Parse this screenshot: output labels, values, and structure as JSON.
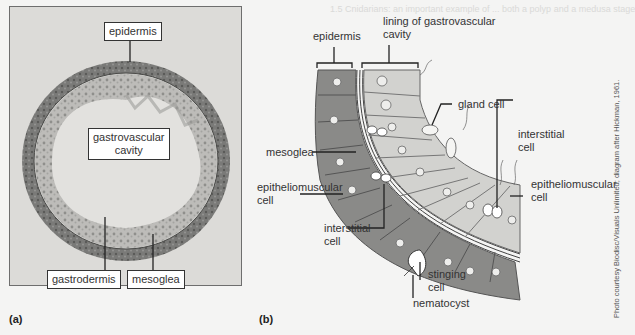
{
  "background_text": {
    "line1": "1.5 Cnidarians: an important example of ... both a polyp and a medusa stage",
    "line2": "Each form ..."
  },
  "panel_a": {
    "panel_label": "(a)",
    "labels": {
      "epidermis": "epidermis",
      "gastrovascular_cavity_line1": "gastrovascular",
      "gastrovascular_cavity_line2": "cavity",
      "gastrodermis": "gastrodermis",
      "mesoglea": "mesoglea"
    }
  },
  "panel_b": {
    "panel_label": "(b)",
    "labels": {
      "epidermis": "epidermis",
      "lining_line1": "lining of gastrovascular",
      "lining_line2": "cavity",
      "gland_cell": "gland cell",
      "mesoglea": "mesoglea",
      "interstitial_cell_right_line1": "interstitial",
      "interstitial_cell_right_line2": "cell",
      "epitheliomuscular_left_line1": "epitheliomuscular",
      "epitheliomuscular_left_line2": "cell",
      "epitheliomuscular_right_line1": "epitheliomuscular",
      "epitheliomuscular_right_line2": "cell",
      "interstitial_cell_left_line1": "interstitial",
      "interstitial_cell_left_line2": "cell",
      "stinging_cell_line1": "stinging",
      "stinging_cell_line2": "cell",
      "nematocyst": "nematocyst"
    }
  },
  "credit": "Photo courtesy Biodisc/Visuals Unlimited; diagram after Hickman, 1961.",
  "colors": {
    "page_bg": "#f4f4f3",
    "photo_bg": "#dcdbd8",
    "tissue_dark": "#6f6f6d",
    "epidermis_cells": "#8a8a88",
    "gastrodermis_cells": "#d2d2cf",
    "label_line": "#222222"
  }
}
